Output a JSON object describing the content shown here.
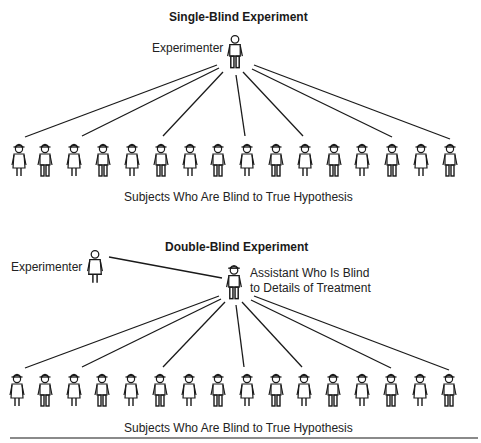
{
  "single_blind": {
    "title": "Single-Blind Experiment",
    "experimenter_label": "Experimenter",
    "subjects_label": "Subjects Who Are Blind to True Hypothesis",
    "subject_count": 16,
    "connected_subjects": [
      1,
      3,
      6,
      9,
      11,
      14,
      16
    ]
  },
  "double_blind": {
    "title": "Double-Blind Experiment",
    "experimenter_label": "Experimenter",
    "assistant_label_line1": "Assistant Who Is Blind",
    "assistant_label_line2": "to Details of Treatment",
    "subjects_label": "Subjects Who Are Blind to True Hypothesis",
    "subject_count": 16,
    "connected_subjects": [
      1,
      3,
      6,
      9,
      11,
      14,
      16
    ]
  },
  "colors": {
    "line": "#1a1a1a",
    "background": "#ffffff",
    "rule": "#8a8a8a"
  }
}
